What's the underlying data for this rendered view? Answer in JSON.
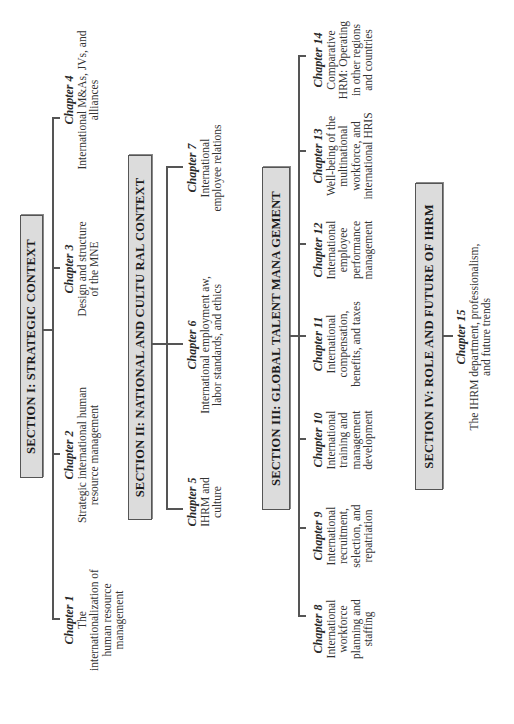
{
  "sections": [
    {
      "id": "I",
      "title": "SECTION I: STRATEGIC CONTEXT",
      "chapters": [
        {
          "title": "Chapter 1",
          "desc": "The internationalization of human resource management"
        },
        {
          "title": "Chapter 2",
          "desc": "Strategic international human resource management"
        },
        {
          "title": "Chapter 3",
          "desc": "Design and structure of the MNE"
        },
        {
          "title": "Chapter 4",
          "desc": "International M&As, JVs, and alliances"
        }
      ]
    },
    {
      "id": "II",
      "title": "SECTION II: NATIONAL AND CULTU RAL CONTEXT",
      "chapters": [
        {
          "title": "Chapter 5",
          "desc": "IHRM and culture"
        },
        {
          "title": "Chapter 6",
          "desc": "International employment aw, labor standards, and ethics"
        },
        {
          "title": "Chapter 7",
          "desc": "International employee relations"
        }
      ]
    },
    {
      "id": "III",
      "title": "SECTION III: GLOBAL TALENT MANA GEMENT",
      "chapters": [
        {
          "title": "Chapter 8",
          "desc": "International workforce planning and staffing"
        },
        {
          "title": "Chapter 9",
          "desc": "International recruitment, selection, and repatriation"
        },
        {
          "title": "Chapter 10",
          "desc": "International training and management development"
        },
        {
          "title": "Chapter 11",
          "desc": "International compensation, benefits, and taxes"
        },
        {
          "title": "Chapter 12",
          "desc": "International employee performance management"
        },
        {
          "title": "Chapter 13",
          "desc": "Well-being of the multinational workforce, and international HRIS"
        },
        {
          "title": "Chapter 14",
          "desc": "Comparative HRM: Operating in other regions and countries"
        }
      ]
    },
    {
      "id": "IV",
      "title": "SECTION IV: ROLE AND FUTURE OF IHRM",
      "chapters": [
        {
          "title": "Chapter 15",
          "desc": "The IHRM department, professionalism, and future trends"
        }
      ]
    }
  ],
  "colors": {
    "box_fill": "#dcdcdc",
    "box_border": "#555555",
    "line": "#555555"
  },
  "orientation": "rotated 90° counter-clockwise"
}
